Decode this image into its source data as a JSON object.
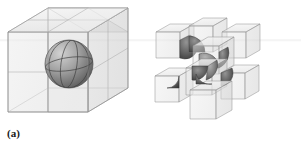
{
  "figure": {
    "label": "(a)",
    "caption_letter": "a",
    "background_color": "#ffffff"
  },
  "colors": {
    "background": "#ffffff",
    "cube_edge": "#8e8e8e",
    "cube_edge_dark": "#6f6f6f",
    "cube_face_light": "#f0f0f0",
    "cube_face_mid": "#e2e2e2",
    "cube_face_dark": "#d2d2d2",
    "sphere_light": "#c9c9c9",
    "sphere_mid": "#9a9a9a",
    "sphere_dark": "#5a5a5a",
    "sphere_line": "#4a4a4a",
    "label_text": "#1a1a1a",
    "artifact_line": "#e9e9e9"
  },
  "assembled_model": {
    "name": "assembled-unit-cell",
    "subdivisions": "2x2x2",
    "inclusion": "sphere",
    "inclusion_count": 1,
    "cube_count": 8
  },
  "exploded_model": {
    "name": "exploded-unit-cells",
    "cube_count": 8,
    "inclusion_per_cube": "sphere-octant",
    "cubes": [
      {
        "id": "cube-1",
        "octant": "octant-a"
      },
      {
        "id": "cube-2",
        "octant": "octant-b"
      },
      {
        "id": "cube-3",
        "octant": "octant-c"
      },
      {
        "id": "cube-4",
        "octant": "octant-d"
      },
      {
        "id": "cube-5",
        "octant": "octant-e"
      },
      {
        "id": "cube-6",
        "octant": "octant-f"
      },
      {
        "id": "cube-7",
        "octant": "octant-g"
      },
      {
        "id": "cube-8",
        "octant": "octant-h"
      }
    ]
  }
}
